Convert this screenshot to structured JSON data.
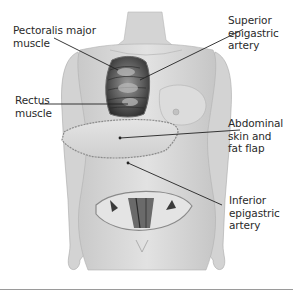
{
  "diagram": {
    "labels": {
      "pectoralis": "Pectoralis major\nmuscle",
      "rectus": "Rectus\nmuscle",
      "superior": "Superior\nepigastric\nartery",
      "abdominal": "Abdominal\nskin and\nfat flap",
      "inferior": "Inferior\nepigastric\nartery"
    },
    "colors": {
      "skin": "#d9d9d9",
      "skin_shade": "#bdbdbd",
      "muscle_dark": "#3a3a3a",
      "muscle_mid": "#8a8a8a",
      "leader_line": "#222222",
      "text": "#2a2a2a",
      "rule": "#9a9a9a"
    }
  }
}
